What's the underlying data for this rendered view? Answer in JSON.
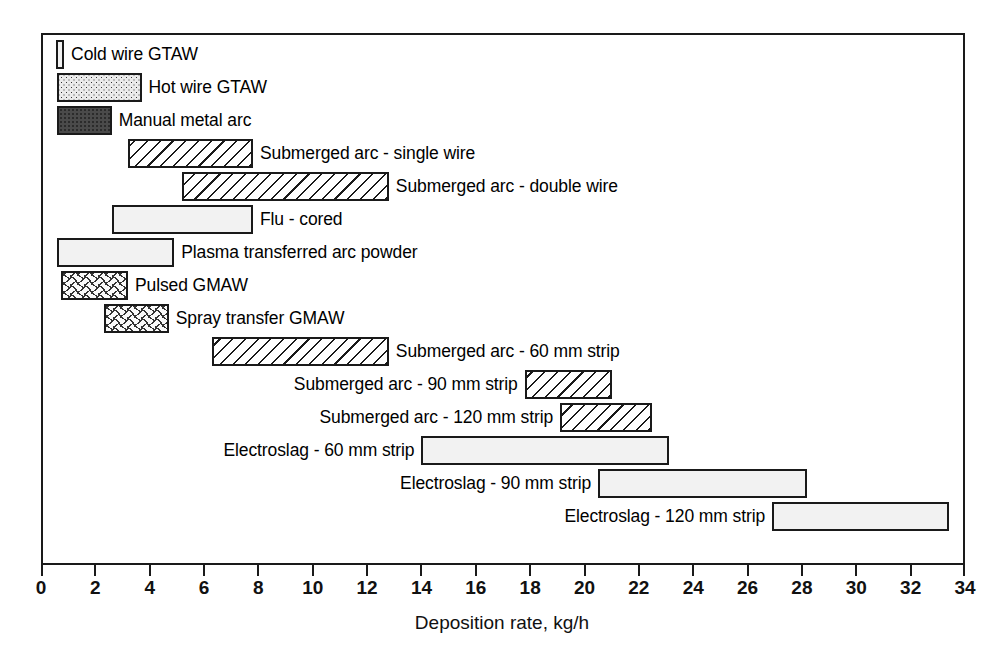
{
  "chart_data": {
    "type": "bar",
    "orientation": "horizontal-range",
    "title": "",
    "xlabel": "Deposition rate, kg/h",
    "ylabel": "",
    "xlim": [
      0,
      34
    ],
    "xticks": [
      0,
      2,
      4,
      6,
      8,
      10,
      12,
      14,
      16,
      18,
      20,
      22,
      24,
      26,
      28,
      30,
      32,
      34
    ],
    "grid": false,
    "legend": "none",
    "frame": true,
    "categories": [
      "Cold wire GTAW",
      "Hot wire GTAW",
      "Manual metal arc",
      "Submerged arc - single wire",
      "Submerged arc - double wire",
      "Flu - cored",
      "Plasma transferred arc powder",
      "Pulsed GMAW",
      "Spray transfer GMAW",
      "Submerged arc - 60 mm strip",
      "Submerged arc - 90  mm strip",
      "Submerged arc  - 120 mm strip",
      "Electroslag - 60 mm strip",
      "Electroslag - 90 mm strip",
      "Electroslag - 120 mm strip"
    ],
    "ranges": [
      [
        0.55,
        0.85
      ],
      [
        0.6,
        3.7
      ],
      [
        0.6,
        2.6
      ],
      [
        3.2,
        7.8
      ],
      [
        5.2,
        12.8
      ],
      [
        2.6,
        7.8
      ],
      [
        0.6,
        4.9
      ],
      [
        0.75,
        3.2
      ],
      [
        2.3,
        4.7
      ],
      [
        6.3,
        12.8
      ],
      [
        17.8,
        21.0
      ],
      [
        19.1,
        22.5
      ],
      [
        14.0,
        23.1
      ],
      [
        20.5,
        28.2
      ],
      [
        26.9,
        33.4
      ]
    ],
    "bars": [
      {
        "label": "Cold wire GTAW",
        "start": 0.55,
        "end": 0.85,
        "fill": "fine-dot",
        "label_side": "right"
      },
      {
        "label": "Hot wire GTAW",
        "start": 0.6,
        "end": 3.7,
        "fill": "med-dot",
        "label_side": "right"
      },
      {
        "label": "Manual metal arc",
        "start": 0.6,
        "end": 2.6,
        "fill": "dark",
        "label_side": "right"
      },
      {
        "label": "Submerged arc - single wire",
        "start": 3.2,
        "end": 7.8,
        "fill": "hatch",
        "label_side": "right"
      },
      {
        "label": "Submerged arc - double wire",
        "start": 5.2,
        "end": 12.8,
        "fill": "hatch",
        "label_side": "right"
      },
      {
        "label": "Flu - cored",
        "start": 2.6,
        "end": 7.8,
        "fill": "fine-dot",
        "label_side": "right"
      },
      {
        "label": "Plasma transferred arc powder",
        "start": 0.6,
        "end": 4.9,
        "fill": "fine-dot",
        "label_side": "right"
      },
      {
        "label": "Pulsed GMAW",
        "start": 0.75,
        "end": 3.2,
        "fill": "dash",
        "label_side": "right"
      },
      {
        "label": "Spray transfer GMAW",
        "start": 2.3,
        "end": 4.7,
        "fill": "dash",
        "label_side": "right"
      },
      {
        "label": "Submerged arc - 60 mm strip",
        "start": 6.3,
        "end": 12.8,
        "fill": "hatch",
        "label_side": "right"
      },
      {
        "label": "Submerged arc - 90  mm strip",
        "start": 17.8,
        "end": 21.0,
        "fill": "hatch",
        "label_side": "left"
      },
      {
        "label": "Submerged arc  - 120 mm strip",
        "start": 19.1,
        "end": 22.5,
        "fill": "hatch",
        "label_side": "left"
      },
      {
        "label": "Electroslag - 60 mm strip",
        "start": 14.0,
        "end": 23.1,
        "fill": "fine-dot",
        "label_side": "left"
      },
      {
        "label": "Electroslag - 90 mm strip",
        "start": 20.5,
        "end": 28.2,
        "fill": "fine-dot",
        "label_side": "left"
      },
      {
        "label": "Electroslag - 120 mm strip",
        "start": 26.9,
        "end": 33.4,
        "fill": "fine-dot",
        "label_side": "left"
      }
    ]
  },
  "axis": {
    "title": "Deposition rate, kg/h",
    "tick_labels": [
      "0",
      "2",
      "4",
      "6",
      "8",
      "10",
      "12",
      "14",
      "16",
      "18",
      "20",
      "22",
      "24",
      "26",
      "28",
      "30",
      "32",
      "34"
    ]
  },
  "colors": {
    "line": "#1a1a1a",
    "text": "#000000",
    "background": "#ffffff",
    "dark_fill": "#4a4a4a",
    "light_fill": "#f2f2f2"
  }
}
